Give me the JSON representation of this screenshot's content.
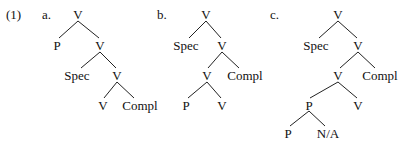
{
  "example_number": "(1)",
  "trees": [
    {
      "id": "a",
      "label": "a.",
      "nodes": [
        {
          "text": "V",
          "x": 78,
          "y": 14
        },
        {
          "text": "P",
          "x": 57,
          "y": 45
        },
        {
          "text": "V",
          "x": 100,
          "y": 45
        },
        {
          "text": "Spec",
          "x": 77,
          "y": 75
        },
        {
          "text": "V",
          "x": 117,
          "y": 75
        },
        {
          "text": "V",
          "x": 103,
          "y": 105
        },
        {
          "text": "Compl",
          "x": 140,
          "y": 105
        }
      ]
    },
    {
      "id": "b",
      "label": "b.",
      "nodes": [
        {
          "text": "V",
          "x": 206,
          "y": 14
        },
        {
          "text": "Spec",
          "x": 186,
          "y": 45
        },
        {
          "text": "V",
          "x": 222,
          "y": 45
        },
        {
          "text": "V",
          "x": 207,
          "y": 75
        },
        {
          "text": "Compl",
          "x": 245,
          "y": 75
        },
        {
          "text": "P",
          "x": 186,
          "y": 105
        },
        {
          "text": "V",
          "x": 222,
          "y": 105
        }
      ]
    },
    {
      "id": "c",
      "label": "c.",
      "nodes": [
        {
          "text": "V",
          "x": 338,
          "y": 14
        },
        {
          "text": "Spec",
          "x": 316,
          "y": 45
        },
        {
          "text": "V",
          "x": 358,
          "y": 45
        },
        {
          "text": "V",
          "x": 338,
          "y": 75
        },
        {
          "text": "Compl",
          "x": 380,
          "y": 75
        },
        {
          "text": "P",
          "x": 309,
          "y": 105
        },
        {
          "text": "V",
          "x": 358,
          "y": 105
        },
        {
          "text": "P",
          "x": 288,
          "y": 133
        },
        {
          "text": "N/A",
          "x": 328,
          "y": 133
        }
      ]
    }
  ]
}
